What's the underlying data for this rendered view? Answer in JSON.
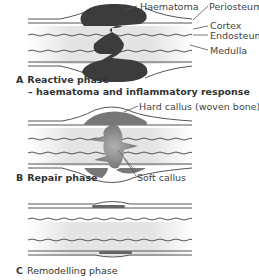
{
  "panels": [
    {
      "letter": "A",
      "title": "Reactive phase",
      "subtitle": "– haematoma and inflammatory response",
      "labels": [
        "Haematoma",
        "Periosteum",
        "Cortex",
        "Endosteum",
        "Medulla"
      ]
    },
    {
      "letter": "B",
      "title": "Repair phase",
      "labels": [
        "Hard callus (woven bone)",
        "Soft callus"
      ]
    },
    {
      "letter": "C",
      "title": "Remodelling phase",
      "labels": []
    }
  ],
  "colors": {
    "haematoma": "#3c3c3c",
    "callus": "#7a7a7a",
    "line": "#555555",
    "medulla": "#e6e6e6"
  }
}
